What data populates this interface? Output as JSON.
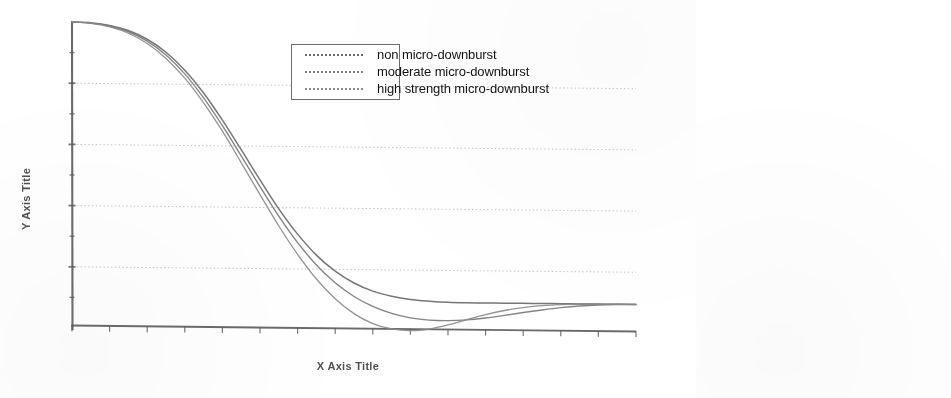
{
  "chart_data": {
    "type": "line",
    "title": "",
    "subtitle": "",
    "xlabel": "X Axis Title",
    "ylabel": "Y Axis Title",
    "grid": true,
    "grid_orientation": "horizontal",
    "legend_position": "top-center",
    "axis_tick_labels_shown": false,
    "xlim": [
      0,
      15
    ],
    "ylim": [
      0,
      10
    ],
    "x_major_ticks": [
      0,
      1,
      2,
      3,
      4,
      5,
      6,
      7,
      8,
      9,
      10,
      11,
      12,
      13,
      14,
      15
    ],
    "y_gridlines": [
      2.0,
      4.0,
      6.0,
      8.0
    ],
    "x": [
      0,
      0.5,
      1,
      1.5,
      2,
      2.5,
      3,
      3.5,
      4,
      4.5,
      5,
      5.5,
      6,
      6.5,
      7,
      7.5,
      8,
      8.5,
      9,
      9.5,
      10,
      10.5,
      11,
      11.5,
      12,
      12.5,
      13,
      13.5,
      14,
      14.5,
      15
    ],
    "series": [
      {
        "name": "non micro-downburst",
        "color": "#6b6b6b",
        "style": "solid",
        "values": [
          10.0,
          9.98,
          9.9,
          9.74,
          9.46,
          9.04,
          8.46,
          7.72,
          6.84,
          5.88,
          4.9,
          3.96,
          3.14,
          2.46,
          1.94,
          1.56,
          1.3,
          1.14,
          1.04,
          0.99,
          0.96,
          0.95,
          0.95,
          0.95,
          0.95,
          0.95,
          0.95,
          0.95,
          0.95,
          0.95,
          0.95
        ]
      },
      {
        "name": "moderate  micro-downburst",
        "color": "#7a7a7a",
        "style": "solid",
        "values": [
          10.0,
          9.97,
          9.88,
          9.7,
          9.4,
          8.95,
          8.34,
          7.56,
          6.66,
          5.68,
          4.68,
          3.72,
          2.86,
          2.14,
          1.56,
          1.12,
          0.8,
          0.58,
          0.44,
          0.37,
          0.36,
          0.39,
          0.46,
          0.55,
          0.65,
          0.74,
          0.82,
          0.88,
          0.92,
          0.94,
          0.95
        ]
      },
      {
        "name": "high strength  micro-downburst",
        "color": "#8a8a8a",
        "style": "solid",
        "values": [
          10.0,
          9.96,
          9.85,
          9.65,
          9.32,
          8.84,
          8.2,
          7.4,
          6.48,
          5.46,
          4.42,
          3.4,
          2.48,
          1.68,
          1.04,
          0.56,
          0.24,
          0.07,
          0.02,
          0.08,
          0.22,
          0.4,
          0.57,
          0.71,
          0.81,
          0.88,
          0.92,
          0.94,
          0.95,
          0.95,
          0.95
        ]
      }
    ]
  },
  "legend": {
    "items": [
      {
        "label": "non micro-downburst"
      },
      {
        "label": "moderate  micro-downburst"
      },
      {
        "label": "high strength  micro-downburst"
      }
    ]
  },
  "axes": {
    "x_title": "X Axis Title",
    "y_title": "Y Axis Title"
  },
  "colors": {
    "axis": "#6a6a6a",
    "grid": "#b9b9b9",
    "text": "#171717",
    "series_1": "#6b6b6b",
    "series_2": "#7a7a7a",
    "series_3": "#8a8a8a"
  }
}
